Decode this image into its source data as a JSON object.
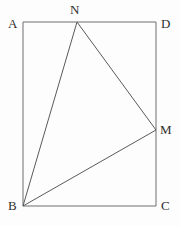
{
  "figure": {
    "type": "geometry-diagram",
    "canvas": {
      "width": 180,
      "height": 226
    },
    "background_color": "#fdfdfd",
    "stroke_color": "#6e6e6e",
    "triangle_stroke_color": "#5a5a5a",
    "label_color": "#2e2e2e",
    "stroke_width": 1,
    "points": {
      "A": {
        "name": "A",
        "x": 23,
        "y": 22
      },
      "D": {
        "name": "D",
        "x": 156,
        "y": 22
      },
      "C": {
        "name": "C",
        "x": 156,
        "y": 206
      },
      "B": {
        "name": "B",
        "x": 23,
        "y": 206
      },
      "N": {
        "name": "N",
        "x": 77,
        "y": 22
      },
      "M": {
        "name": "M",
        "x": 156,
        "y": 130
      }
    },
    "rectangle_path": "M 23 22 L 156 22 L 156 206 L 23 206 Z",
    "triangle_path": "M 23 206 L 77 22 L 156 130 Z",
    "segments": [
      {
        "name": "AD",
        "from": "A",
        "to": "D",
        "d": "M 23 22 L 156 22"
      },
      {
        "name": "DC",
        "from": "D",
        "to": "C",
        "d": "M 156 22 L 156 206"
      },
      {
        "name": "CB",
        "from": "C",
        "to": "B",
        "d": "M 156 206 L 23 206"
      },
      {
        "name": "BA",
        "from": "B",
        "to": "A",
        "d": "M 23 206 L 23 22"
      },
      {
        "name": "BN",
        "from": "B",
        "to": "N",
        "d": "M 23 206 L 77 22"
      },
      {
        "name": "NM",
        "from": "N",
        "to": "M",
        "d": "M 77 22 L 156 130"
      },
      {
        "name": "BM",
        "from": "B",
        "to": "M",
        "d": "M 23 206 L 156 130"
      }
    ],
    "labels": [
      {
        "id": "A",
        "text": "A",
        "left": 8,
        "top": 17
      },
      {
        "id": "N",
        "text": "N",
        "left": 70,
        "top": 3
      },
      {
        "id": "D",
        "text": "D",
        "left": 161,
        "top": 17
      },
      {
        "id": "M",
        "text": "M",
        "left": 160,
        "top": 123
      },
      {
        "id": "B",
        "text": "B",
        "left": 8,
        "top": 199
      },
      {
        "id": "C",
        "text": "C",
        "left": 161,
        "top": 199
      }
    ]
  }
}
